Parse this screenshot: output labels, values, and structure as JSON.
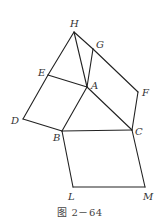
{
  "figure": {
    "caption": "图 2－64",
    "stroke_color": "#222222",
    "points": {
      "H": {
        "x": 74,
        "y": 32,
        "label": "H",
        "lx": 70,
        "ly": 27
      },
      "G": {
        "x": 93,
        "y": 49,
        "label": "G",
        "lx": 96,
        "ly": 48
      },
      "E": {
        "x": 48,
        "y": 75,
        "label": "E",
        "lx": 38,
        "ly": 76
      },
      "A": {
        "x": 87,
        "y": 87,
        "label": "A",
        "lx": 91,
        "ly": 89
      },
      "F": {
        "x": 138,
        "y": 92,
        "label": "F",
        "lx": 142,
        "ly": 96
      },
      "D": {
        "x": 23,
        "y": 119,
        "label": "D",
        "lx": 11,
        "ly": 124
      },
      "B": {
        "x": 62,
        "y": 131,
        "label": "B",
        "lx": 53,
        "ly": 141
      },
      "C": {
        "x": 132,
        "y": 130,
        "label": "C",
        "lx": 135,
        "ly": 135
      },
      "L": {
        "x": 73,
        "y": 187,
        "label": "L",
        "lx": 68,
        "ly": 200
      },
      "M": {
        "x": 145,
        "y": 187,
        "label": "M",
        "lx": 143,
        "ly": 200
      }
    },
    "segments": [
      [
        "H",
        "G"
      ],
      [
        "G",
        "F"
      ],
      [
        "F",
        "C"
      ],
      [
        "H",
        "E"
      ],
      [
        "E",
        "D"
      ],
      [
        "D",
        "B"
      ],
      [
        "H",
        "A"
      ],
      [
        "G",
        "A"
      ],
      [
        "E",
        "A"
      ],
      [
        "A",
        "B"
      ],
      [
        "A",
        "C"
      ],
      [
        "B",
        "C"
      ],
      [
        "B",
        "L"
      ],
      [
        "L",
        "M"
      ],
      [
        "M",
        "C"
      ]
    ]
  }
}
